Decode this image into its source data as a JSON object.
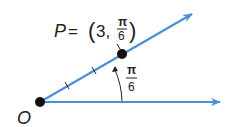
{
  "diagram": {
    "type": "polar-coordinate-point",
    "point_label": "P",
    "equals": "=",
    "coords_open": "(",
    "r_value": "3,",
    "theta_numerator": "π",
    "theta_denominator": "6",
    "coords_close": ")",
    "origin_label": "O",
    "angle_numerator": "π",
    "angle_denominator": "6",
    "ray_color": "#4a90d9",
    "point_color": "#111111",
    "tick_marks_on_ray": 2
  }
}
